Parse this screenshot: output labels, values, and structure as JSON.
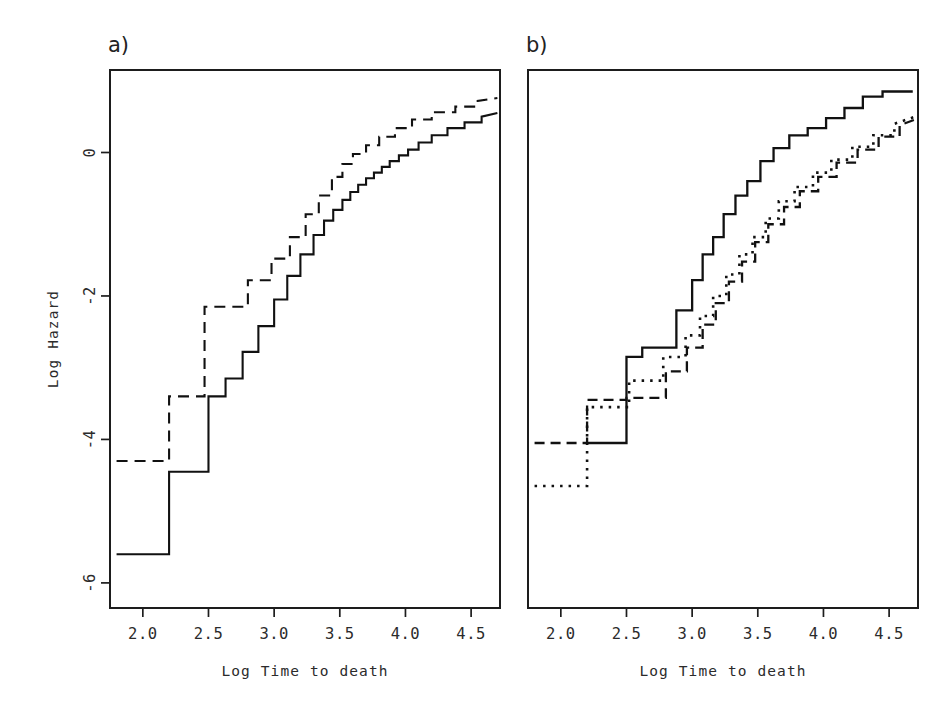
{
  "figure": {
    "width": 942,
    "height": 715,
    "background": "#ffffff",
    "line_color": "#111111"
  },
  "chart_data": {
    "type": "line",
    "title": "",
    "subtitle": "",
    "xlabel": "Log Time to death",
    "ylabel": "Log Hazard",
    "grid": false,
    "legend": "none",
    "xlim": [
      1.75,
      4.72
    ],
    "ylim": [
      -6.35,
      1.15
    ],
    "xticks": [
      2.0,
      2.5,
      3.0,
      3.5,
      4.0,
      4.5
    ],
    "xtick_labels": [
      "2.0",
      "2.5",
      "3.0",
      "3.5",
      "4.0",
      "4.5"
    ],
    "yticks": [
      0,
      -2,
      -4,
      -6
    ],
    "ytick_labels": [
      "0",
      "-2",
      "-4",
      "-6"
    ],
    "panels": [
      {
        "tag": "a)",
        "xlabel": "Log Time to death",
        "ylabel": "Log Hazard",
        "series": [
          {
            "name": "group-1-solid",
            "style": "solid",
            "dash": "none",
            "width": 2.1,
            "x": [
              1.8,
              2.2,
              2.2,
              2.5,
              2.5,
              2.63,
              2.63,
              2.76,
              2.76,
              2.88,
              2.88,
              3.0,
              3.0,
              3.1,
              3.1,
              3.2,
              3.2,
              3.3,
              3.3,
              3.38,
              3.38,
              3.45,
              3.45,
              3.52,
              3.52,
              3.58,
              3.58,
              3.64,
              3.64,
              3.7,
              3.7,
              3.76,
              3.76,
              3.82,
              3.82,
              3.88,
              3.88,
              3.95,
              3.95,
              4.02,
              4.02,
              4.1,
              4.1,
              4.2,
              4.2,
              4.32,
              4.32,
              4.45,
              4.45,
              4.58,
              4.58,
              4.7
            ],
            "y": [
              -5.6,
              -5.6,
              -4.45,
              -4.45,
              -3.4,
              -3.4,
              -3.15,
              -3.15,
              -2.78,
              -2.78,
              -2.42,
              -2.42,
              -2.05,
              -2.05,
              -1.72,
              -1.72,
              -1.42,
              -1.42,
              -1.15,
              -1.15,
              -0.95,
              -0.95,
              -0.8,
              -0.8,
              -0.66,
              -0.66,
              -0.55,
              -0.55,
              -0.45,
              -0.45,
              -0.36,
              -0.36,
              -0.28,
              -0.28,
              -0.2,
              -0.2,
              -0.12,
              -0.12,
              -0.04,
              -0.04,
              0.04,
              0.04,
              0.14,
              0.14,
              0.24,
              0.24,
              0.34,
              0.34,
              0.42,
              0.42,
              0.5,
              0.55
            ]
          },
          {
            "name": "group-2-dashed",
            "style": "dashed",
            "dash": "11,7",
            "width": 2.1,
            "x": [
              1.8,
              2.2,
              2.2,
              2.47,
              2.47,
              2.8,
              2.8,
              2.98,
              2.98,
              3.12,
              3.12,
              3.24,
              3.24,
              3.34,
              3.34,
              3.44,
              3.44,
              3.52,
              3.52,
              3.6,
              3.6,
              3.7,
              3.7,
              3.8,
              3.8,
              3.92,
              3.92,
              4.05,
              4.05,
              4.2,
              4.2,
              4.38,
              4.38,
              4.55,
              4.55,
              4.7
            ],
            "y": [
              -4.3,
              -4.3,
              -3.4,
              -3.4,
              -2.15,
              -2.15,
              -1.78,
              -1.78,
              -1.48,
              -1.48,
              -1.18,
              -1.18,
              -0.86,
              -0.86,
              -0.6,
              -0.6,
              -0.34,
              -0.34,
              -0.16,
              -0.16,
              -0.02,
              -0.02,
              0.1,
              0.1,
              0.22,
              0.22,
              0.34,
              0.34,
              0.46,
              0.46,
              0.56,
              0.56,
              0.64,
              0.64,
              0.72,
              0.76
            ]
          }
        ]
      },
      {
        "tag": "b)",
        "xlabel": "Log Time to death",
        "ylabel": "",
        "series": [
          {
            "name": "group-1-solid",
            "style": "solid",
            "dash": "none",
            "width": 2.3,
            "x": [
              2.2,
              2.5,
              2.5,
              2.62,
              2.62,
              2.88,
              2.88,
              3.0,
              3.0,
              3.08,
              3.08,
              3.16,
              3.16,
              3.24,
              3.24,
              3.33,
              3.33,
              3.42,
              3.42,
              3.52,
              3.52,
              3.62,
              3.62,
              3.74,
              3.74,
              3.88,
              3.88,
              4.02,
              4.02,
              4.16,
              4.16,
              4.3,
              4.3,
              4.45,
              4.45,
              4.68
            ],
            "y": [
              -4.05,
              -4.05,
              -2.85,
              -2.85,
              -2.72,
              -2.72,
              -2.2,
              -2.2,
              -1.78,
              -1.78,
              -1.42,
              -1.42,
              -1.18,
              -1.18,
              -0.86,
              -0.86,
              -0.6,
              -0.6,
              -0.4,
              -0.4,
              -0.12,
              -0.12,
              0.06,
              0.06,
              0.24,
              0.24,
              0.34,
              0.34,
              0.48,
              0.48,
              0.62,
              0.62,
              0.78,
              0.78,
              0.85,
              0.85
            ]
          },
          {
            "name": "group-2-dashed",
            "style": "dashed",
            "dash": "10,6",
            "width": 2.3,
            "x": [
              1.8,
              2.2,
              2.2,
              2.5,
              2.5,
              2.8,
              2.8,
              2.96,
              2.96,
              3.08,
              3.08,
              3.18,
              3.18,
              3.28,
              3.28,
              3.38,
              3.38,
              3.48,
              3.48,
              3.58,
              3.58,
              3.7,
              3.7,
              3.82,
              3.82,
              3.96,
              3.96,
              4.1,
              4.1,
              4.26,
              4.26,
              4.42,
              4.42,
              4.58,
              4.58,
              4.7
            ],
            "y": [
              -4.05,
              -4.05,
              -3.45,
              -3.45,
              -3.42,
              -3.42,
              -3.05,
              -3.05,
              -2.72,
              -2.72,
              -2.4,
              -2.4,
              -2.1,
              -2.1,
              -1.8,
              -1.8,
              -1.52,
              -1.52,
              -1.25,
              -1.25,
              -1.0,
              -1.0,
              -0.76,
              -0.76,
              -0.54,
              -0.54,
              -0.34,
              -0.34,
              -0.14,
              -0.14,
              0.04,
              0.04,
              0.22,
              0.22,
              0.38,
              0.46
            ]
          },
          {
            "name": "group-3-dotted",
            "style": "dotted",
            "dash": "2.5,6",
            "width": 2.6,
            "x": [
              1.8,
              2.2,
              2.2,
              2.52,
              2.52,
              2.78,
              2.78,
              2.95,
              2.95,
              3.06,
              3.06,
              3.16,
              3.16,
              3.26,
              3.26,
              3.36,
              3.36,
              3.46,
              3.46,
              3.56,
              3.56,
              3.66,
              3.66,
              3.78,
              3.78,
              3.92,
              3.92,
              4.06,
              4.06,
              4.22,
              4.22,
              4.38,
              4.38,
              4.54,
              4.54,
              4.7
            ],
            "y": [
              -4.65,
              -4.65,
              -3.55,
              -3.55,
              -3.18,
              -3.18,
              -2.85,
              -2.85,
              -2.55,
              -2.55,
              -2.28,
              -2.28,
              -2.0,
              -2.0,
              -1.7,
              -1.7,
              -1.42,
              -1.42,
              -1.18,
              -1.18,
              -0.92,
              -0.92,
              -0.68,
              -0.68,
              -0.48,
              -0.48,
              -0.28,
              -0.28,
              -0.1,
              -0.1,
              0.08,
              0.08,
              0.24,
              0.24,
              0.4,
              0.5
            ]
          }
        ]
      }
    ]
  },
  "layout": {
    "panel_a": {
      "left": 110,
      "right": 500,
      "top": 70,
      "bottom": 608
    },
    "panel_b": {
      "left": 528,
      "right": 918,
      "top": 70,
      "bottom": 608
    },
    "tag_a_pos": {
      "x": 108,
      "y": 52
    },
    "tag_b_pos": {
      "x": 526,
      "y": 52
    },
    "xlabel_a_pos": {
      "x": 305,
      "y": 676
    },
    "xlabel_b_pos": {
      "x": 723,
      "y": 676
    },
    "ylabel_pos": {
      "x": 58,
      "y": 339
    }
  }
}
